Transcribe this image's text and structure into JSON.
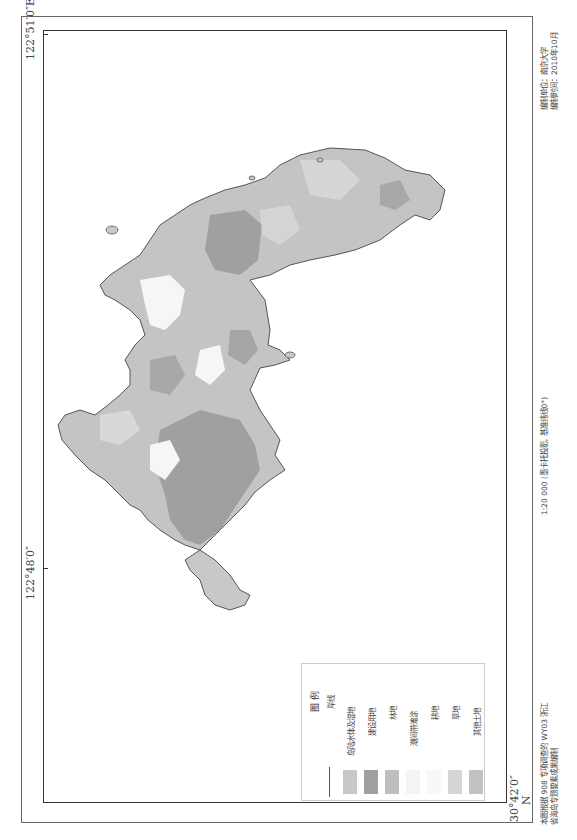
{
  "map": {
    "coords": {
      "top_right": "122°51′0″E",
      "left_middle": "122°48′0″",
      "bottom_left": "30°42′0″",
      "north": "N"
    },
    "scale_text": "1:20 000 (墨卡托投影, 基准纬线0°)",
    "credits": {
      "line1": "编制单位：南京大学",
      "line2": "编制时间：2010年10月"
    },
    "source_note": {
      "line1": "本图根据 908 专项调查的 WY03 浙江",
      "line2": "省海岛专题要素成果编制"
    },
    "colors": {
      "coastline": "#555555",
      "water_wetland": "#c8c8c8",
      "construction": "#a0a0a0",
      "forest": "#bebebe",
      "intertidal": "#f4f4f4",
      "farmland": "#f8f8f8",
      "grassland": "#d6d6d6",
      "other_land": "#c2c2c2"
    }
  },
  "legend": {
    "title": "图 例",
    "items": [
      {
        "key": "coastline",
        "label": "岸线",
        "type": "line",
        "color": "#555555"
      },
      {
        "key": "water_wetland",
        "label": "岛陆水体及湿地",
        "type": "fill",
        "color": "#c8c8c8"
      },
      {
        "key": "construction",
        "label": "建设用地",
        "type": "fill",
        "color": "#a0a0a0"
      },
      {
        "key": "forest",
        "label": "林地",
        "type": "fill",
        "color": "#bebebe"
      },
      {
        "key": "intertidal",
        "label": "潮间带滩涂",
        "type": "fill",
        "color": "#f4f4f4"
      },
      {
        "key": "farmland",
        "label": "耕地",
        "type": "fill",
        "color": "#f8f8f8"
      },
      {
        "key": "grassland",
        "label": "草地",
        "type": "fill",
        "color": "#d6d6d6"
      },
      {
        "key": "other_land",
        "label": "其他土地",
        "type": "fill",
        "color": "#c2c2c2"
      }
    ]
  }
}
